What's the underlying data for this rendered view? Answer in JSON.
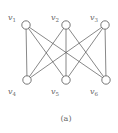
{
  "diagram": {
    "type": "bipartite-graph",
    "caption": "(a)",
    "nodes": [
      {
        "id": "v1",
        "label": "v",
        "sub": "1",
        "x": 26,
        "y": 25,
        "lx": 8,
        "ly": 20
      },
      {
        "id": "v2",
        "label": "v",
        "sub": "2",
        "x": 66,
        "y": 25,
        "lx": 51,
        "ly": 20
      },
      {
        "id": "v3",
        "label": "v",
        "sub": "3",
        "x": 105,
        "y": 25,
        "lx": 90,
        "ly": 20
      },
      {
        "id": "v4",
        "label": "v",
        "sub": "4",
        "x": 27,
        "y": 80,
        "lx": 8,
        "ly": 94
      },
      {
        "id": "v5",
        "label": "v",
        "sub": "5",
        "x": 66,
        "y": 80,
        "lx": 51,
        "ly": 94
      },
      {
        "id": "v6",
        "label": "v",
        "sub": "6",
        "x": 106,
        "y": 80,
        "lx": 90,
        "ly": 94
      }
    ],
    "edges": [
      [
        "v1",
        "v4"
      ],
      [
        "v1",
        "v5"
      ],
      [
        "v1",
        "v6"
      ],
      [
        "v2",
        "v4"
      ],
      [
        "v2",
        "v5"
      ],
      [
        "v2",
        "v6"
      ],
      [
        "v3",
        "v4"
      ],
      [
        "v3",
        "v5"
      ],
      [
        "v3",
        "v6"
      ]
    ],
    "colors": {
      "stroke": "#555555",
      "text": "#666666",
      "background": "#ffffff"
    }
  }
}
